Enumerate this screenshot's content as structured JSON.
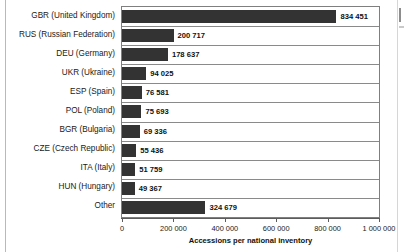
{
  "chart_data": {
    "type": "bar",
    "orientation": "horizontal",
    "title": "",
    "xlabel": "Accessions per national inventory",
    "ylabel": "",
    "xlim": [
      0,
      1000000
    ],
    "xticks": [
      0,
      200000,
      400000,
      600000,
      800000,
      1000000
    ],
    "xticklabels": [
      "0",
      "200 000",
      "400 000",
      "600 000",
      "800 000",
      "1 000 000"
    ],
    "grid": true,
    "legend": false,
    "bar_color": "#333333",
    "categories": [
      "GBR (United Kingdom)",
      "RUS (Russian Federation)",
      "DEU (Germany)",
      "UKR (Ukraine)",
      "ESP (Spain)",
      "POL (Poland)",
      "BGR (Bulgaria)",
      "CZE (Czech Republic)",
      "ITA (Italy)",
      "HUN (Hungary)",
      "Other"
    ],
    "values": [
      834451,
      200717,
      178637,
      94025,
      76581,
      75693,
      69336,
      55436,
      51759,
      49367,
      324679
    ],
    "value_labels": [
      "834 451",
      "200 717",
      "178 637",
      "94 025",
      "76 581",
      "75 693",
      "69 336",
      "55 436",
      "51 759",
      "49 367",
      "324 679"
    ]
  }
}
